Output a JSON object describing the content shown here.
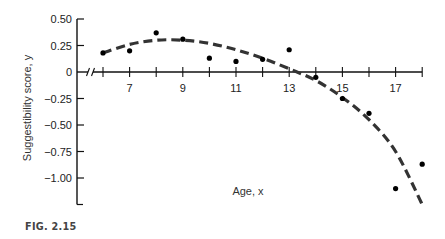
{
  "chart_data": {
    "type": "scatter",
    "title": "",
    "xlabel": "Age, x",
    "ylabel": "Suggestibility score, y",
    "xlim": [
      6,
      18
    ],
    "ylim": [
      -1.25,
      0.5
    ],
    "x_ticks": [
      6,
      7,
      8,
      9,
      10,
      11,
      12,
      13,
      14,
      15,
      16,
      17,
      18
    ],
    "x_tick_labels": [
      "7",
      "9",
      "11",
      "13",
      "15",
      "17"
    ],
    "x_tick_label_values": [
      7,
      9,
      11,
      13,
      15,
      17
    ],
    "y_ticks": [
      0.5,
      0.25,
      0,
      -0.25,
      -0.5,
      -0.75,
      -1.0
    ],
    "y_tick_labels": [
      "0.50",
      "0.25",
      "0",
      "−0.25",
      "−0.50",
      "−0.75",
      "−1.00"
    ],
    "grid": false,
    "axis_break": true,
    "series": [
      {
        "name": "Observed scores",
        "style": "points",
        "x": [
          6,
          7,
          8,
          9,
          10,
          11,
          12,
          13,
          14,
          15,
          16,
          17,
          18
        ],
        "y": [
          0.18,
          0.2,
          0.37,
          0.31,
          0.13,
          0.1,
          0.12,
          0.21,
          -0.05,
          -0.25,
          -0.39,
          -1.1,
          -0.87
        ]
      },
      {
        "name": "Fitted quadratic curve",
        "style": "dashed-line",
        "x": [
          6,
          7,
          8,
          9,
          10,
          11,
          12,
          13,
          14,
          15,
          16,
          17,
          18
        ],
        "y": [
          0.18,
          0.26,
          0.3,
          0.3,
          0.27,
          0.21,
          0.13,
          0.03,
          -0.08,
          -0.24,
          -0.45,
          -0.75,
          -1.25
        ]
      }
    ]
  },
  "caption": "FIG. 2.15",
  "colors": {
    "axis": "#111111",
    "points": "#000000",
    "curve": "#333333",
    "text": "#222222"
  }
}
